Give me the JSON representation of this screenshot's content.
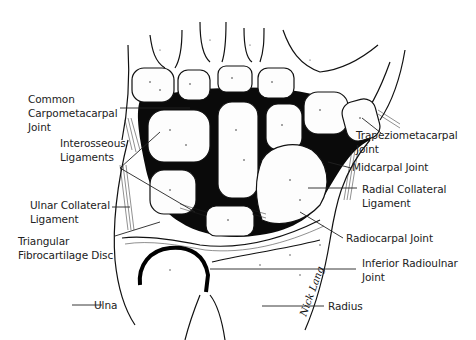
{
  "figure": {
    "colors": {
      "ink": "#111111",
      "background": "#ffffff",
      "joint_space": "#0a0a0a"
    },
    "signature": "Nick Lang"
  },
  "labels": {
    "left": [
      {
        "id": "common_carpometacarpal_joint",
        "text": "Common\nCarpometacarpal\nJoint"
      },
      {
        "id": "interosseous_ligaments",
        "text": "Interosseous\nLigaments"
      },
      {
        "id": "ulnar_collateral_ligament",
        "text": "Ulnar Collateral\nLigament"
      },
      {
        "id": "triangular_fibrocartilage_disc",
        "text": "Triangular\nFibrocartilage Disc"
      },
      {
        "id": "ulna",
        "text": "Ulna"
      }
    ],
    "right": [
      {
        "id": "trapeziometacarpal_joint",
        "text": "Trapeziometacarpal\nJoint"
      },
      {
        "id": "midcarpal_joint",
        "text": "Midcarpal Joint"
      },
      {
        "id": "radial_collateral_ligament",
        "text": "Radial Collateral\nLigament"
      },
      {
        "id": "radiocarpal_joint",
        "text": "Radiocarpal Joint"
      },
      {
        "id": "inferior_radioulnar_joint",
        "text": "Inferior Radioulnar\nJoint"
      },
      {
        "id": "radius",
        "text": "Radius"
      }
    ]
  }
}
